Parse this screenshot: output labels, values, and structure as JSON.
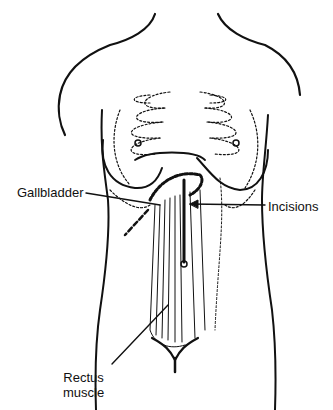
{
  "figure": {
    "labels": {
      "gallbladder": "Gallbladder",
      "incisions": "Incisions",
      "rectus_line1": "Rectus",
      "rectus_line2": "muscle"
    },
    "colors": {
      "ink": "#111111",
      "background": "#ffffff"
    }
  }
}
